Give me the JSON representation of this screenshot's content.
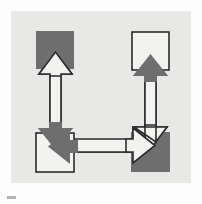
{
  "figure": {
    "type": "block-diagram",
    "canvas": {
      "width": 202,
      "height": 204
    },
    "panel": {
      "x": 11,
      "y": 11,
      "width": 180,
      "height": 172,
      "fill": "#e8e8e6"
    },
    "colors": {
      "page_background": "#fdfdfd",
      "panel_background": "#e8e8e6",
      "node_filled": "#6e6e6e",
      "node_open": "#f2f2f0",
      "stroke": "#2b2b2b",
      "arrow_solid": "#6e6e6e",
      "arrow_open": "#f2f2f0"
    },
    "nodes": [
      {
        "id": "top-left",
        "label": "",
        "style": "filled",
        "fill": "#6e6e6e",
        "x": 36,
        "y": 31,
        "width": 38,
        "height": 38
      },
      {
        "id": "top-right",
        "label": "",
        "style": "open",
        "fill": "#f2f2f0",
        "x": 132,
        "y": 32,
        "width": 37,
        "height": 38
      },
      {
        "id": "bottom-left",
        "label": "",
        "style": "open",
        "fill": "#f2f2f0",
        "x": 36,
        "y": 133,
        "width": 38,
        "height": 39
      },
      {
        "id": "bottom-right",
        "label": "",
        "style": "filled",
        "fill": "#6e6e6e",
        "x": 131,
        "y": 132,
        "width": 39,
        "height": 40
      }
    ],
    "connections": [
      {
        "id": "left-vertical",
        "from": "bottom-left",
        "to": "top-left",
        "orientation": "vertical",
        "bidirectional": true,
        "arrows": [
          {
            "direction": "up",
            "style": "open"
          },
          {
            "direction": "down",
            "style": "solid"
          }
        ]
      },
      {
        "id": "bottom-horizontal",
        "from": "bottom-left",
        "to": "bottom-right",
        "orientation": "horizontal",
        "bidirectional": true,
        "arrows": [
          {
            "direction": "right",
            "style": "open"
          },
          {
            "direction": "left",
            "style": "solid"
          }
        ]
      },
      {
        "id": "right-vertical",
        "from": "bottom-right",
        "to": "top-right",
        "orientation": "vertical",
        "bidirectional": true,
        "arrows": [
          {
            "direction": "up",
            "style": "solid"
          },
          {
            "direction": "down",
            "style": "open"
          }
        ]
      }
    ],
    "artifact": {
      "present": true,
      "description": "small dark scan smudge below panel at lower-left"
    }
  }
}
